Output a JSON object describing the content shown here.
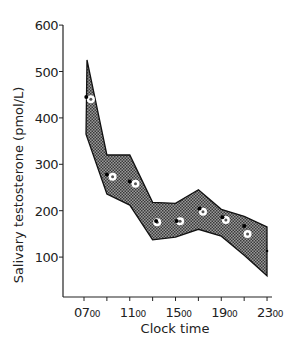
{
  "chart_data": {
    "type": "area",
    "title": "",
    "xlabel": "Clock time",
    "ylabel": "Salivary testosterone (pmol/L)",
    "ylim": [
      0,
      600
    ],
    "yticks": [
      100,
      200,
      300,
      400,
      500,
      600
    ],
    "x_tick_hours": [
      7,
      9,
      11,
      13,
      15,
      17,
      19,
      21,
      23
    ],
    "x_tick_labels": [
      {
        "hour": 7,
        "main": "07",
        "sub": "00"
      },
      {
        "hour": 11,
        "main": "11",
        "sub": "00"
      },
      {
        "hour": 15,
        "main": "15",
        "sub": "00"
      },
      {
        "hour": 19,
        "main": "19",
        "sub": "00"
      },
      {
        "hour": 23,
        "main": "23",
        "sub": "00"
      }
    ],
    "grid": false,
    "legend": "none",
    "x": [
      7,
      9,
      11,
      13,
      15,
      17,
      19,
      21,
      23
    ],
    "band": {
      "name": "Reference range",
      "upper": [
        525,
        320,
        320,
        218,
        216,
        245,
        203,
        188,
        165
      ],
      "lower": [
        365,
        236,
        212,
        137,
        143,
        160,
        145,
        104,
        60
      ],
      "fill": "#7a7a7a"
    },
    "series": [
      {
        "name": "Open circles",
        "marker": "open-circle",
        "x": [
          7.6,
          9.5,
          11.5,
          13.4,
          15.4,
          17.4,
          19.4,
          21.3
        ],
        "values": [
          440,
          273,
          258,
          175,
          177,
          198,
          180,
          150
        ]
      },
      {
        "name": "Filled dots",
        "marker": "filled-dot",
        "x": [
          7.2,
          9.0,
          11.0,
          13.3,
          15.1,
          17.1,
          19.1,
          21.0,
          23.0
        ],
        "values": [
          445,
          278,
          263,
          178,
          178,
          205,
          186,
          167,
          113
        ]
      }
    ]
  }
}
